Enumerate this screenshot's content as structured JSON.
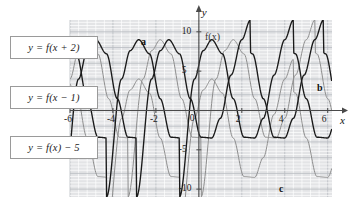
{
  "figure": {
    "kind": "coordinate-grid-graph",
    "background": "#ffffff",
    "plot_area": {
      "left": 70,
      "top": 20,
      "right": 332,
      "bottom": 197
    },
    "grid": {
      "minor_color": "#ffffff",
      "major_color": "#b9bcc2",
      "panel_color": "#e3e4e6",
      "minor_step_units": 0.4,
      "major_step_units": 2
    },
    "axis_color": "#4a4a4a"
  },
  "axes": {
    "x_label": "x",
    "y_label": "y",
    "x_ticks": [
      "-6",
      "-4",
      "-2",
      "2",
      "4",
      "6"
    ],
    "y_ticks": [
      "10",
      "5",
      "-5",
      "-10"
    ],
    "origin_label": "0",
    "xlim": [
      -6.0,
      6.2
    ],
    "ylim": [
      -11.0,
      11.5
    ]
  },
  "answer_boxes": [
    {
      "id": "box-a",
      "text": "y = f(x + 2)"
    },
    {
      "id": "box-b",
      "text": "y = f(x − 1)"
    },
    {
      "id": "box-c",
      "text": "y = f(x) − 5"
    }
  ],
  "curve_labels": [
    {
      "id": "label-a",
      "text": "a"
    },
    {
      "id": "label-b",
      "text": "b"
    },
    {
      "id": "label-c",
      "text": "c"
    },
    {
      "id": "label-fx",
      "text": "f(x)"
    }
  ],
  "chart_data": {
    "type": "line",
    "title": "",
    "xlabel": "x",
    "ylabel": "y",
    "xlim": [
      -6.0,
      6.2
    ],
    "ylim": [
      -11.0,
      11.5
    ],
    "xticks": [
      -6,
      -4,
      -2,
      0,
      2,
      4,
      6
    ],
    "yticks": [
      -10,
      -5,
      0,
      5,
      10
    ],
    "grid": true,
    "legend": "none",
    "base_function": {
      "name": "f(x)",
      "color": "#1a1a1a",
      "description": "oscillating curve: maximum about 9 near x = 0.6, minimum about -3.5 near x = 2.0, second maximum about 9 near x = 3.4, rising steeply after x = 4.5",
      "key_points": [
        {
          "x": -0.9,
          "y": -11.0
        },
        {
          "x": -0.2,
          "y": 4.0
        },
        {
          "x": 0.2,
          "y": 7.6
        },
        {
          "x": 0.6,
          "y": 9.0
        },
        {
          "x": 1.1,
          "y": 7.2
        },
        {
          "x": 1.6,
          "y": 1.5
        },
        {
          "x": 2.1,
          "y": -3.4
        },
        {
          "x": 2.6,
          "y": -3.5
        },
        {
          "x": 3.0,
          "y": -1.0
        },
        {
          "x": 3.5,
          "y": 4.5
        },
        {
          "x": 4.0,
          "y": 9.0
        },
        {
          "x": 4.4,
          "y": 11.5
        }
      ]
    },
    "series": [
      {
        "name": "a",
        "label": "y = f(x + 2)",
        "color": "#1a1a1a",
        "transform": "horizontal shift left 2",
        "shift_x": -2.0,
        "shift_y": 0.0
      },
      {
        "name": "b",
        "label": "y = f(x - 1)",
        "color": "#8e8e8e",
        "transform": "horizontal shift right 1",
        "shift_x": 1.0,
        "shift_y": 0.0
      },
      {
        "name": "c",
        "label": "y = f(x) - 5",
        "color": "#8e8e8e",
        "transform": "vertical shift down 5",
        "shift_x": 0.0,
        "shift_y": -5.0
      }
    ]
  }
}
